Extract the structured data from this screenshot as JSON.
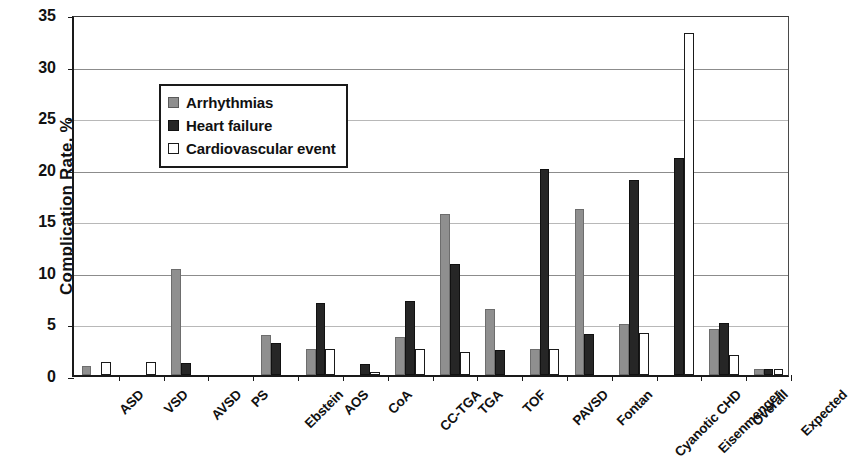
{
  "chart_data": {
    "type": "bar",
    "title": "",
    "xlabel": "",
    "ylabel": "Complication Rate, %",
    "ylim": [
      0,
      35
    ],
    "yticks": [
      0,
      5,
      10,
      15,
      20,
      25,
      30,
      35
    ],
    "grid": true,
    "legend_position": "inside-upper-left",
    "categories": [
      "ASD",
      "VSD",
      "AVSD",
      "PS",
      "Ebstein",
      "AOS",
      "CoA",
      "CC-TGA",
      "TGA",
      "TOF",
      "PAVSD",
      "Fontan",
      "Cyanotic CHD",
      "Eisenmenger",
      "Overall",
      "Expected"
    ],
    "series": [
      {
        "name": "Arrhythmias",
        "color": "#8f8f8f",
        "values": [
          0.9,
          0,
          10.3,
          0,
          3.9,
          2.5,
          0,
          3.7,
          15.6,
          6.4,
          2.5,
          16.1,
          4.9,
          0,
          4.5,
          0.6
        ]
      },
      {
        "name": "Heart failure",
        "color": "#262626",
        "values": [
          0,
          0,
          1.2,
          0,
          3.1,
          7.0,
          1.1,
          7.2,
          10.8,
          2.4,
          20.0,
          4.0,
          18.9,
          21.0,
          5.0,
          0.6
        ]
      },
      {
        "name": "Cardiovascular event",
        "color": "#ffffff",
        "values": [
          1.3,
          1.3,
          0,
          0,
          0,
          2.5,
          0.3,
          2.5,
          2.2,
          0,
          2.5,
          0,
          4.1,
          33.2,
          1.9,
          0.6
        ]
      }
    ]
  }
}
